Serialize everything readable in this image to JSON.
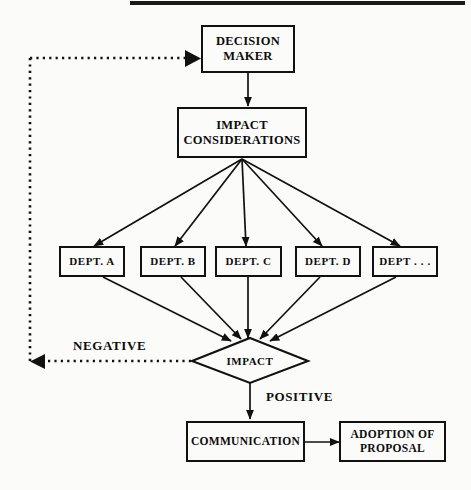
{
  "diagram": {
    "type": "flowchart",
    "background_color": "#fbfbf9",
    "line_color": "#111111",
    "text_color": "#0d0d0d",
    "top_rule": {
      "present": true
    },
    "nodes": {
      "decision_maker": {
        "label": "DECISION\nMAKER",
        "line1": "DECISION",
        "line2": "MAKER",
        "shape": "rectangle"
      },
      "impact_considerations": {
        "label": "IMPACT\nCONSIDERATIONS",
        "line1": "IMPACT",
        "line2": "CONSIDERATIONS",
        "shape": "rectangle"
      },
      "impact": {
        "label": "IMPACT",
        "shape": "diamond"
      },
      "communication": {
        "label": "COMMUNICATION",
        "shape": "rectangle"
      },
      "adoption": {
        "label": "ADOPTION OF\nPROPOSAL",
        "line1": "ADOPTION OF",
        "line2": "PROPOSAL",
        "shape": "rectangle"
      }
    },
    "departments": [
      {
        "label": "DEPT.  A"
      },
      {
        "label": "DEPT.  B"
      },
      {
        "label": "DEPT.  C"
      },
      {
        "label": "DEPT.  D"
      },
      {
        "label": "DEPT . . ."
      }
    ],
    "edge_labels": {
      "negative": "NEGATIVE",
      "positive": "POSITIVE"
    },
    "edges": [
      {
        "from": "decision_maker",
        "to": "impact_considerations",
        "style": "solid"
      },
      {
        "from": "impact_considerations",
        "to": "departments",
        "style": "solid"
      },
      {
        "from": "departments",
        "to": "impact",
        "style": "solid"
      },
      {
        "from": "impact",
        "to": "decision_maker",
        "style": "dotted",
        "label": "NEGATIVE"
      },
      {
        "from": "impact",
        "to": "communication",
        "style": "solid",
        "label": "POSITIVE"
      },
      {
        "from": "communication",
        "to": "adoption",
        "style": "solid"
      }
    ]
  }
}
